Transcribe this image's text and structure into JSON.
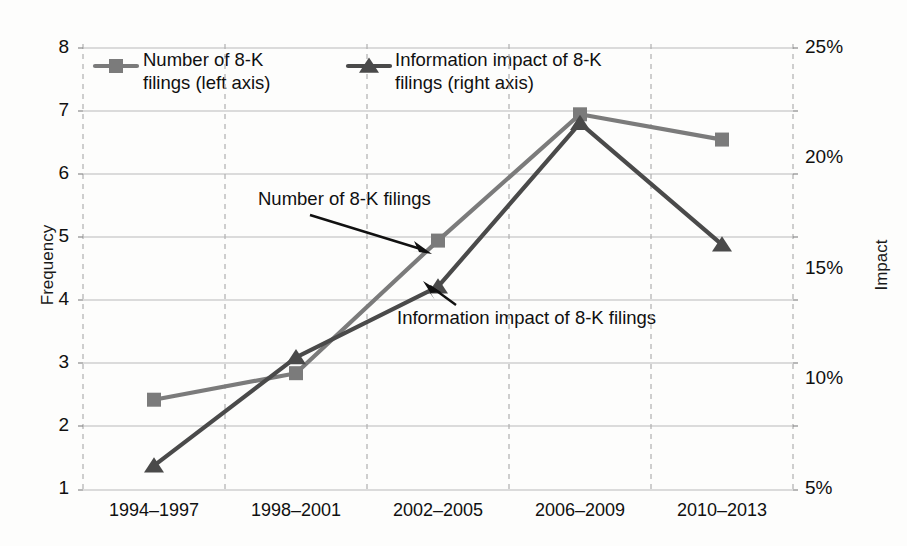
{
  "chart_data": {
    "type": "line",
    "title": "",
    "categories": [
      "1994–1997",
      "1998–2001",
      "2002–2005",
      "2006–2009",
      "2010–2013"
    ],
    "series": [
      {
        "name": "Number of 8-K filings (left axis)",
        "axis": "left",
        "marker": "square",
        "color": "#7b7b7b",
        "values": [
          2.43,
          2.85,
          4.95,
          6.95,
          6.55
        ]
      },
      {
        "name": "Information impact of 8-K filings (right axis)",
        "axis": "right",
        "marker": "triangle",
        "color": "#4a4a4a",
        "values": [
          6.1,
          11.0,
          14.2,
          21.6,
          16.1
        ]
      }
    ],
    "xlabel": "",
    "ylabel": "Frequency",
    "y2label": "Impact",
    "ylim": [
      1,
      8
    ],
    "y2lim": [
      5,
      25
    ],
    "yticks": [
      "1",
      "2",
      "3",
      "4",
      "5",
      "6",
      "7",
      "8"
    ],
    "y2ticks": [
      "5%",
      "10%",
      "15%",
      "20%",
      "25%"
    ],
    "grid": "horizontal-solid-and-vertical-dashed",
    "legend_position": "top-inside"
  },
  "legend": {
    "items": [
      {
        "label": "Number of 8-K\nfilings (left axis)",
        "marker": "square",
        "color": "#7b7b7b"
      },
      {
        "label": "Information impact of 8-K\nfilings (right axis)",
        "marker": "triangle",
        "color": "#4a4a4a"
      }
    ]
  },
  "annotations": [
    {
      "text": "Number of 8-K filings",
      "points_to": "frequency-series"
    },
    {
      "text": "Information impact of 8-K filings",
      "points_to": "impact-series"
    }
  ],
  "axes": {
    "left_title": "Frequency",
    "right_title": "Impact"
  }
}
